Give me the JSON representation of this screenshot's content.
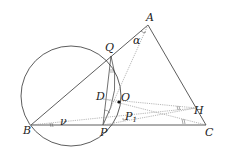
{
  "diagram": {
    "type": "geometry",
    "points": {
      "A": {
        "label": "A",
        "x": 148,
        "y": 25
      },
      "Q": {
        "label": "Q",
        "x": 111,
        "y": 56
      },
      "B": {
        "label": "B",
        "x": 31,
        "y": 125
      },
      "P": {
        "label": "P",
        "x": 103,
        "y": 125
      },
      "C": {
        "label": "C",
        "x": 206,
        "y": 125
      },
      "H": {
        "label": "H",
        "x": 196,
        "y": 108
      },
      "O": {
        "label": "O",
        "x": 119,
        "y": 102
      },
      "D": {
        "label": "D"
      },
      "P1": {
        "label": "P",
        "subscript": "1"
      }
    },
    "angles": {
      "alpha": "α",
      "nu": "ν"
    },
    "circle": {
      "cx": 71,
      "cy": 96,
      "r": 50
    },
    "colors": {
      "line": "#333333",
      "dotted": "#777777",
      "text": "#222222"
    }
  }
}
